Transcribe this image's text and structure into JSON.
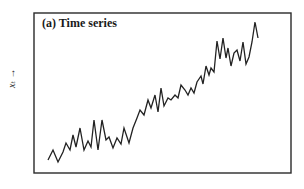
{
  "chart_data": {
    "type": "line",
    "title": "(a) Time series",
    "xlabel": "",
    "ylabel": "x_t →",
    "grid": false,
    "legend": null,
    "axis_ticks": "none",
    "trend": "increasing with noise",
    "frame": {
      "left": 34,
      "top": 13,
      "right": 291,
      "bottom": 173
    },
    "series": [
      {
        "name": "x_t",
        "color": "#222222",
        "points_px": [
          [
            48,
            160
          ],
          [
            53,
            150
          ],
          [
            58,
            162
          ],
          [
            63,
            152
          ],
          [
            66,
            143
          ],
          [
            70,
            150
          ],
          [
            73,
            135
          ],
          [
            76,
            147
          ],
          [
            80,
            128
          ],
          [
            84,
            150
          ],
          [
            88,
            141
          ],
          [
            91,
            147
          ],
          [
            94,
            120
          ],
          [
            98,
            150
          ],
          [
            102,
            120
          ],
          [
            106,
            140
          ],
          [
            109,
            137
          ],
          [
            113,
            148
          ],
          [
            117,
            138
          ],
          [
            121,
            144
          ],
          [
            124,
            128
          ],
          [
            129,
            143
          ],
          [
            133,
            128
          ],
          [
            137,
            118
          ],
          [
            140,
            110
          ],
          [
            144,
            115
          ],
          [
            148,
            100
          ],
          [
            151,
            108
          ],
          [
            155,
            95
          ],
          [
            158,
            112
          ],
          [
            161,
            88
          ],
          [
            164,
            106
          ],
          [
            168,
            98
          ],
          [
            171,
            100
          ],
          [
            175,
            95
          ],
          [
            178,
            98
          ],
          [
            181,
            85
          ],
          [
            185,
            90
          ],
          [
            188,
            95
          ],
          [
            191,
            88
          ],
          [
            194,
            93
          ],
          [
            197,
            82
          ],
          [
            201,
            76
          ],
          [
            203,
            84
          ],
          [
            206,
            66
          ],
          [
            209,
            75
          ],
          [
            211,
            68
          ],
          [
            214,
            72
          ],
          [
            217,
            41
          ],
          [
            220,
            59
          ],
          [
            223,
            38
          ],
          [
            226,
            58
          ],
          [
            228,
            48
          ],
          [
            231,
            66
          ],
          [
            234,
            53
          ],
          [
            237,
            50
          ],
          [
            240,
            61
          ],
          [
            243,
            42
          ],
          [
            246,
            64
          ],
          [
            249,
            57
          ],
          [
            252,
            42
          ],
          [
            255,
            22
          ],
          [
            258,
            38
          ]
        ]
      }
    ]
  },
  "labels": {
    "title": "(a) Time series",
    "ylabel": "xₜ →"
  }
}
